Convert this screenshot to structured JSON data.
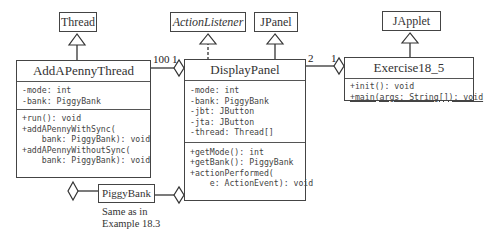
{
  "diagram": {
    "type": "UML class diagram",
    "superclasses": {
      "thread": "Thread",
      "action_listener": "ActionListener",
      "jpanel": "JPanel",
      "japplet": "JApplet"
    },
    "classes": {
      "add_a_penny_thread": {
        "name": "AddAPennyThread",
        "attributes": [
          "-mode: int",
          "-bank: PiggyBank"
        ],
        "methods": [
          "+run(): void",
          "+addAPennyWithSync(",
          "    bank: PiggyBank): void",
          "+addAPennyWithoutSync(",
          "    bank: PiggyBank): void"
        ]
      },
      "display_panel": {
        "name": "DisplayPanel",
        "attributes": [
          "-mode: int",
          "-bank: PiggyBank",
          "-jbt: JButton",
          "-jta: JButton",
          "-thread: Thread[]"
        ],
        "methods": [
          "+getMode(): int",
          "+getBank(): PiggyBank",
          "+actionPerformed(",
          "    e: ActionEvent): void"
        ]
      },
      "exercise18_5": {
        "name": "Exercise18_5",
        "attributes": [],
        "methods": [
          "+init(): void",
          "+main(args: String[]): void"
        ]
      },
      "piggy_bank": {
        "name": "PiggyBank"
      }
    },
    "multiplicities": {
      "thread_to_panel_many": "100",
      "thread_to_panel_one": "1",
      "panel_to_exercise_many": "2",
      "panel_to_exercise_one": "1"
    },
    "note": {
      "line1": "Same as in",
      "line2": "Example 18.3"
    }
  }
}
